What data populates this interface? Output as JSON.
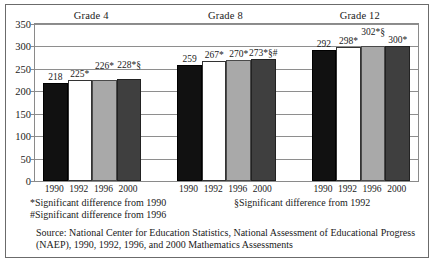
{
  "chart_data": {
    "type": "bar",
    "title": "",
    "xlabel": "",
    "ylabel": "",
    "ylim": [
      0,
      350
    ],
    "yticks": [
      0,
      50,
      100,
      150,
      200,
      250,
      300,
      350
    ],
    "grid": true,
    "legend": "none",
    "group_labels": [
      "Grade 4",
      "Grade 8",
      "Grade 12"
    ],
    "categories": [
      "1990",
      "1992",
      "1996",
      "2000"
    ],
    "series": [
      {
        "name": "Grade 4",
        "values": [
          218,
          225,
          226,
          228
        ]
      },
      {
        "name": "Grade 8",
        "values": [
          259,
          267,
          270,
          273
        ]
      },
      {
        "name": "Grade 12",
        "values": [
          292,
          298,
          302,
          300
        ]
      }
    ],
    "bar_labels": [
      [
        "218",
        "225*",
        "226*",
        "228*§"
      ],
      [
        "259",
        "267*",
        "270*",
        "273*§#"
      ],
      [
        "292",
        "298*",
        "302*§",
        "300*"
      ]
    ],
    "bar_colors": [
      "#111111",
      "#ffffff",
      "#a9a9a9",
      "#3f3f3f"
    ],
    "annotations": [
      "*Significant difference from 1990",
      "§Significant difference from 1992",
      "#Significant difference from 1996"
    ]
  },
  "groups": [
    {
      "label": "Grade 4",
      "bars": [
        {
          "year": "1990",
          "value": 218,
          "label": "218",
          "color_name": "black",
          "raised": false
        },
        {
          "year": "1992",
          "value": 225,
          "label": "225*",
          "color_name": "white",
          "raised": false
        },
        {
          "year": "1996",
          "value": 226,
          "label": "226*",
          "color_name": "lgray",
          "raised": true
        },
        {
          "year": "2000",
          "value": 228,
          "label": "228*§",
          "color_name": "dgray",
          "raised": true
        }
      ]
    },
    {
      "label": "Grade 8",
      "bars": [
        {
          "year": "1990",
          "value": 259,
          "label": "259",
          "color_name": "black",
          "raised": false
        },
        {
          "year": "1992",
          "value": 267,
          "label": "267*",
          "color_name": "white",
          "raised": false
        },
        {
          "year": "1996",
          "value": 270,
          "label": "270*",
          "color_name": "lgray",
          "raised": false
        },
        {
          "year": "2000",
          "value": 273,
          "label": "273*§#",
          "color_name": "dgray",
          "raised": false
        }
      ]
    },
    {
      "label": "Grade 12",
      "bars": [
        {
          "year": "1990",
          "value": 292,
          "label": "292",
          "color_name": "black",
          "raised": false
        },
        {
          "year": "1992",
          "value": 298,
          "label": "298*",
          "color_name": "white",
          "raised": false
        },
        {
          "year": "1996",
          "value": 302,
          "label": "302*§",
          "color_name": "lgray",
          "raised": true
        },
        {
          "year": "2000",
          "value": 300,
          "label": "300*",
          "color_name": "dgray",
          "raised": false
        }
      ]
    }
  ],
  "footnotes": {
    "star": "*Significant difference from 1990",
    "section": "§Significant difference from 1992",
    "hash": "#Significant difference from 1996"
  },
  "source": {
    "line1": "Source: National Center for Education Statistics, National Assessment of Educational Progress",
    "line2": "(NAEP), 1990, 1992, 1996, and 2000 Mathematics Assessments"
  }
}
